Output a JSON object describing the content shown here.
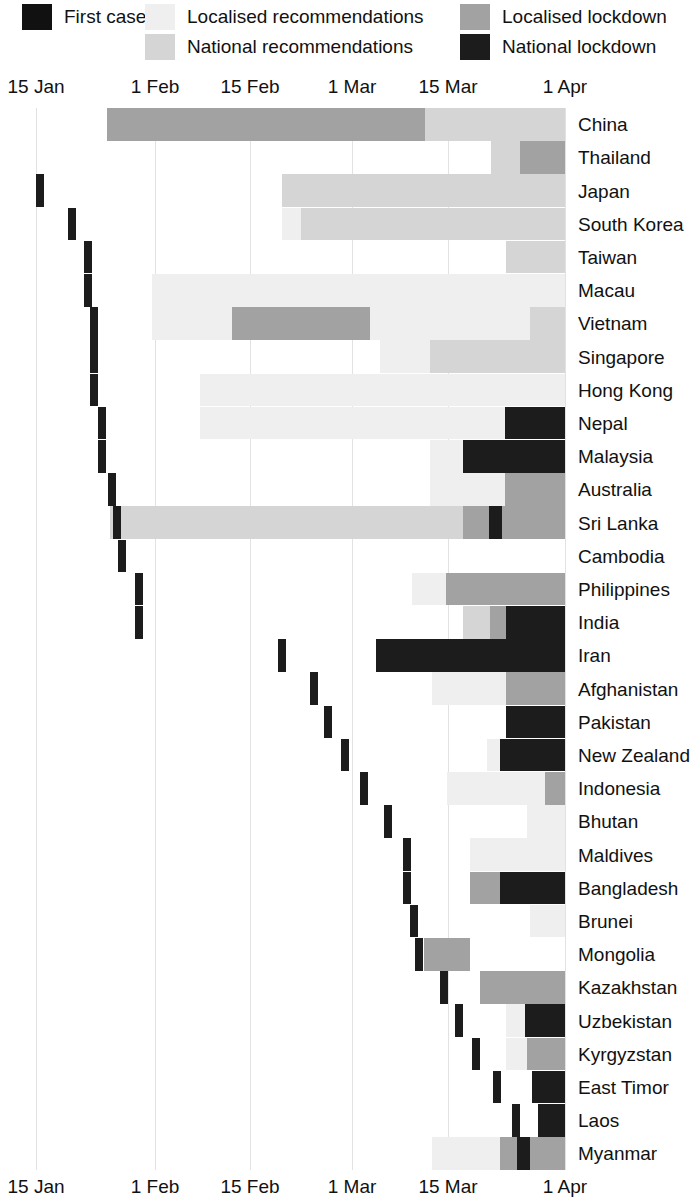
{
  "legend": {
    "items": [
      {
        "label": "First case",
        "color": "#111111",
        "key": "first_case"
      },
      {
        "label": "Localised recommendations",
        "color": "#efefef",
        "key": "localised_recommendations"
      },
      {
        "label": "National recommendations",
        "color": "#d5d5d5",
        "key": "national_recommendations"
      },
      {
        "label": "Localised lockdown",
        "color": "#a2a2a2",
        "key": "localised_lockdown"
      },
      {
        "label": "National lockdown",
        "color": "#1c1c1c",
        "key": "national_lockdown"
      }
    ]
  },
  "axis": {
    "ticks": [
      "15 Jan",
      "1 Feb",
      "15 Feb",
      "1 Mar",
      "15 Mar",
      "1 Apr"
    ],
    "tick_x": [
      36,
      155,
      250,
      352,
      448,
      565
    ]
  },
  "chart_data": {
    "type": "timeline",
    "title": "",
    "xlabel": "",
    "ylabel": "",
    "xlim": [
      "15 Jan",
      "1 Apr"
    ],
    "grid": true,
    "legend_position": "top",
    "colors": {
      "first_case": "#1c1c1c",
      "localised_recommendations": "#efefef",
      "national_recommendations": "#d5d5d5",
      "localised_lockdown": "#a2a2a2",
      "national_lockdown": "#1c1c1c"
    },
    "categories": [
      "China",
      "Thailand",
      "Japan",
      "South Korea",
      "Taiwan",
      "Macau",
      "Vietnam",
      "Singapore",
      "Hong Kong",
      "Nepal",
      "Malaysia",
      "Australia",
      "Sri Lanka",
      "Cambodia",
      "Philippines",
      "India",
      "Iran",
      "Afghanistan",
      "Pakistan",
      "New Zealand",
      "Indonesia",
      "Bhutan",
      "Maldives",
      "Bangladesh",
      "Brunei",
      "Mongolia",
      "Kazakhstan",
      "Uzbekistan",
      "Kyrgyzstan",
      "East Timor",
      "Laos",
      "Myanmar"
    ],
    "rows": [
      {
        "name": "China",
        "first_case": null,
        "segments": [
          {
            "t": "localised_lockdown",
            "x0": 107,
            "x1": 425
          },
          {
            "t": "national_recommendations",
            "x0": 425,
            "x1": 565
          }
        ]
      },
      {
        "name": "Thailand",
        "first_case": null,
        "segments": [
          {
            "t": "national_recommendations",
            "x0": 491,
            "x1": 520
          },
          {
            "t": "localised_lockdown",
            "x0": 520,
            "x1": 565
          }
        ]
      },
      {
        "name": "Japan",
        "first_case": 36,
        "segments": [
          {
            "t": "national_recommendations",
            "x0": 282,
            "x1": 565
          }
        ]
      },
      {
        "name": "South Korea",
        "first_case": 68,
        "segments": [
          {
            "t": "localised_recommendations",
            "x0": 282,
            "x1": 301
          },
          {
            "t": "national_recommendations",
            "x0": 301,
            "x1": 565
          }
        ]
      },
      {
        "name": "Taiwan",
        "first_case": 84,
        "segments": [
          {
            "t": "national_recommendations",
            "x0": 506,
            "x1": 565
          }
        ]
      },
      {
        "name": "Macau",
        "first_case": 84,
        "segments": [
          {
            "t": "localised_recommendations",
            "x0": 152,
            "x1": 565
          }
        ]
      },
      {
        "name": "Vietnam",
        "first_case": 90,
        "segments": [
          {
            "t": "localised_recommendations",
            "x0": 152,
            "x1": 232
          },
          {
            "t": "localised_lockdown",
            "x0": 232,
            "x1": 370
          },
          {
            "t": "localised_recommendations",
            "x0": 370,
            "x1": 530
          },
          {
            "t": "national_recommendations",
            "x0": 530,
            "x1": 565
          }
        ]
      },
      {
        "name": "Singapore",
        "first_case": 90,
        "segments": [
          {
            "t": "localised_recommendations",
            "x0": 380,
            "x1": 430
          },
          {
            "t": "national_recommendations",
            "x0": 430,
            "x1": 565
          }
        ]
      },
      {
        "name": "Hong Kong",
        "first_case": 90,
        "segments": [
          {
            "t": "localised_recommendations",
            "x0": 200,
            "x1": 565
          }
        ]
      },
      {
        "name": "Nepal",
        "first_case": 98,
        "segments": [
          {
            "t": "localised_recommendations",
            "x0": 200,
            "x1": 505
          },
          {
            "t": "national_lockdown",
            "x0": 505,
            "x1": 565
          }
        ]
      },
      {
        "name": "Malaysia",
        "first_case": 98,
        "segments": [
          {
            "t": "localised_recommendations",
            "x0": 430,
            "x1": 463
          },
          {
            "t": "national_lockdown",
            "x0": 463,
            "x1": 565
          }
        ]
      },
      {
        "name": "Australia",
        "first_case": 108,
        "segments": [
          {
            "t": "localised_recommendations",
            "x0": 430,
            "x1": 505
          },
          {
            "t": "localised_lockdown",
            "x0": 505,
            "x1": 565
          }
        ]
      },
      {
        "name": "Sri Lanka",
        "first_case": 113,
        "segments": [
          {
            "t": "national_recommendations",
            "x0": 110,
            "x1": 463
          },
          {
            "t": "localised_lockdown",
            "x0": 463,
            "x1": 489
          },
          {
            "t": "national_lockdown",
            "x0": 489,
            "x1": 502
          },
          {
            "t": "localised_lockdown",
            "x0": 502,
            "x1": 565
          }
        ]
      },
      {
        "name": "Cambodia",
        "first_case": 118,
        "segments": []
      },
      {
        "name": "Philippines",
        "first_case": 135,
        "segments": [
          {
            "t": "localised_recommendations",
            "x0": 412,
            "x1": 446
          },
          {
            "t": "localised_lockdown",
            "x0": 446,
            "x1": 565
          }
        ]
      },
      {
        "name": "India",
        "first_case": 135,
        "segments": [
          {
            "t": "national_recommendations",
            "x0": 463,
            "x1": 490
          },
          {
            "t": "localised_lockdown",
            "x0": 490,
            "x1": 506
          },
          {
            "t": "national_lockdown",
            "x0": 506,
            "x1": 565
          }
        ]
      },
      {
        "name": "Iran",
        "first_case": 278,
        "segments": [
          {
            "t": "national_lockdown",
            "x0": 376,
            "x1": 565
          }
        ]
      },
      {
        "name": "Afghanistan",
        "first_case": 310,
        "segments": [
          {
            "t": "localised_recommendations",
            "x0": 432,
            "x1": 506
          },
          {
            "t": "localised_lockdown",
            "x0": 506,
            "x1": 565
          }
        ]
      },
      {
        "name": "Pakistan",
        "first_case": 324,
        "segments": [
          {
            "t": "national_lockdown",
            "x0": 506,
            "x1": 565
          }
        ]
      },
      {
        "name": "New Zealand",
        "first_case": 341,
        "segments": [
          {
            "t": "localised_recommendations",
            "x0": 487,
            "x1": 500
          },
          {
            "t": "national_lockdown",
            "x0": 500,
            "x1": 565
          }
        ]
      },
      {
        "name": "Indonesia",
        "first_case": 360,
        "segments": [
          {
            "t": "localised_recommendations",
            "x0": 447,
            "x1": 545
          },
          {
            "t": "localised_lockdown",
            "x0": 545,
            "x1": 565
          }
        ]
      },
      {
        "name": "Bhutan",
        "first_case": 384,
        "segments": [
          {
            "t": "localised_recommendations",
            "x0": 527,
            "x1": 565
          }
        ]
      },
      {
        "name": "Maldives",
        "first_case": 403,
        "segments": [
          {
            "t": "localised_recommendations",
            "x0": 470,
            "x1": 565
          }
        ]
      },
      {
        "name": "Bangladesh",
        "first_case": 403,
        "segments": [
          {
            "t": "localised_lockdown",
            "x0": 470,
            "x1": 500
          },
          {
            "t": "national_lockdown",
            "x0": 500,
            "x1": 565
          }
        ]
      },
      {
        "name": "Brunei",
        "first_case": 410,
        "segments": [
          {
            "t": "localised_recommendations",
            "x0": 530,
            "x1": 565
          }
        ]
      },
      {
        "name": "Mongolia",
        "first_case": 415,
        "segments": [
          {
            "t": "localised_lockdown",
            "x0": 424,
            "x1": 470
          }
        ]
      },
      {
        "name": "Kazakhstan",
        "first_case": 440,
        "segments": [
          {
            "t": "localised_lockdown",
            "x0": 480,
            "x1": 565
          }
        ]
      },
      {
        "name": "Uzbekistan",
        "first_case": 455,
        "segments": [
          {
            "t": "localised_recommendations",
            "x0": 506,
            "x1": 525
          },
          {
            "t": "national_lockdown",
            "x0": 525,
            "x1": 565
          }
        ]
      },
      {
        "name": "Kyrgyzstan",
        "first_case": 472,
        "segments": [
          {
            "t": "localised_recommendations",
            "x0": 506,
            "x1": 527
          },
          {
            "t": "localised_lockdown",
            "x0": 527,
            "x1": 565
          }
        ]
      },
      {
        "name": "East Timor",
        "first_case": 493,
        "segments": [
          {
            "t": "national_lockdown",
            "x0": 532,
            "x1": 565
          }
        ]
      },
      {
        "name": "Laos",
        "first_case": 512,
        "segments": [
          {
            "t": "national_lockdown",
            "x0": 538,
            "x1": 565
          }
        ]
      },
      {
        "name": "Myanmar",
        "first_case": null,
        "segments": [
          {
            "t": "localised_recommendations",
            "x0": 432,
            "x1": 500
          },
          {
            "t": "localised_lockdown",
            "x0": 500,
            "x1": 517
          },
          {
            "t": "national_lockdown",
            "x0": 517,
            "x1": 530
          },
          {
            "t": "localised_lockdown",
            "x0": 530,
            "x1": 565
          }
        ]
      }
    ]
  }
}
